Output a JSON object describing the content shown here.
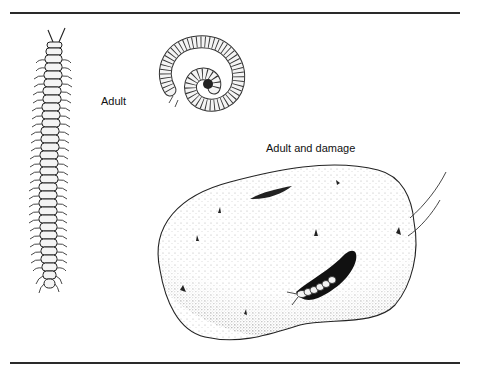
{
  "figure": {
    "labels": {
      "adult": "Adult",
      "adult_and_damage": "Adult and damage"
    },
    "illustrations": [
      {
        "id": "millipede-extended",
        "description": "Adult millipede, extended, top view"
      },
      {
        "id": "millipede-coiled",
        "description": "Adult millipede, coiled"
      },
      {
        "id": "potato-damage",
        "description": "Potato tuber with feeding cavities and millipede emerging from a hole"
      }
    ],
    "colors": {
      "ink": "#111111",
      "rule": "#2a2a2a",
      "background": "#ffffff"
    }
  }
}
